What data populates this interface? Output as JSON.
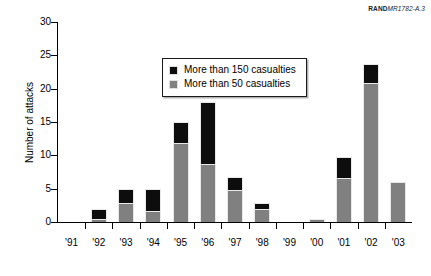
{
  "source_tag": {
    "brand": "RAND",
    "document_id": "MR1782-A.3"
  },
  "legend": {
    "position": "upper-left-inside",
    "items": [
      {
        "label": "More than 150 casualties",
        "color": "#0d0d0d",
        "swatch": "black-square-swatch"
      },
      {
        "label": "More than 50 casualties",
        "color": "#808080",
        "swatch": "gray-square-swatch"
      }
    ]
  },
  "chart_data": {
    "type": "bar",
    "stacked": true,
    "title": "",
    "subtitle": "",
    "xlabel": "",
    "ylabel": "Number of attacks",
    "categories": [
      "'91",
      "'92",
      "'93",
      "'94",
      "'95",
      "'96",
      "'97",
      "'98",
      "'99",
      "'00",
      "'01",
      "'02",
      "'03"
    ],
    "series": [
      {
        "name": "More than 50 casualties",
        "color": "#808080",
        "values": [
          0,
          0.5,
          2.8,
          1.7,
          11.8,
          8.7,
          4.8,
          2.0,
          0,
          0.5,
          6.6,
          20.8,
          6.0
        ]
      },
      {
        "name": "More than 150 casualties",
        "color": "#0d0d0d",
        "values": [
          0,
          1.5,
          2.2,
          3.3,
          3.2,
          9.3,
          2.0,
          0.8,
          0,
          0,
          3.2,
          2.9,
          0
        ]
      }
    ],
    "totals": [
      0,
      2,
      5,
      5,
      15,
      18,
      6.8,
      2.8,
      0,
      0.5,
      9.8,
      23.7,
      6.0
    ],
    "ylim": [
      0,
      30
    ],
    "yticks": [
      0,
      5,
      10,
      15,
      20,
      25,
      30
    ],
    "ytick_labels": [
      "0",
      "5",
      "10",
      "15",
      "20",
      "25",
      "30"
    ],
    "grid": false,
    "legend_position": "upper-left"
  }
}
